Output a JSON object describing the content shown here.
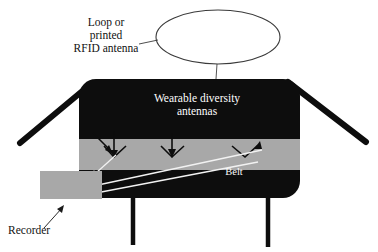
{
  "figure": {
    "labels": {
      "rfid_antenna": "Loop or\nprinted\nRFID antenna",
      "wearable_antennas": "Wearable diversity\nantennas",
      "belt": "Belt",
      "recorder": "Recorder"
    },
    "colors": {
      "body": "#0d0d0d",
      "belt": "#a8a8a8",
      "recorder_box": "#a8a8a8",
      "background": "#ffffff",
      "label_light": "#fdfdfd",
      "label_dark": "#111111",
      "leader_line": "#3a3a3a"
    },
    "elements": {
      "loop_antenna_shape": "ellipse-outline",
      "torso_shape": "rounded-rectangle",
      "belt_shape": "horizontal-band",
      "antenna_markers": 3,
      "arms": 2,
      "legs": 2,
      "recorder_shape": "rectangle"
    }
  }
}
